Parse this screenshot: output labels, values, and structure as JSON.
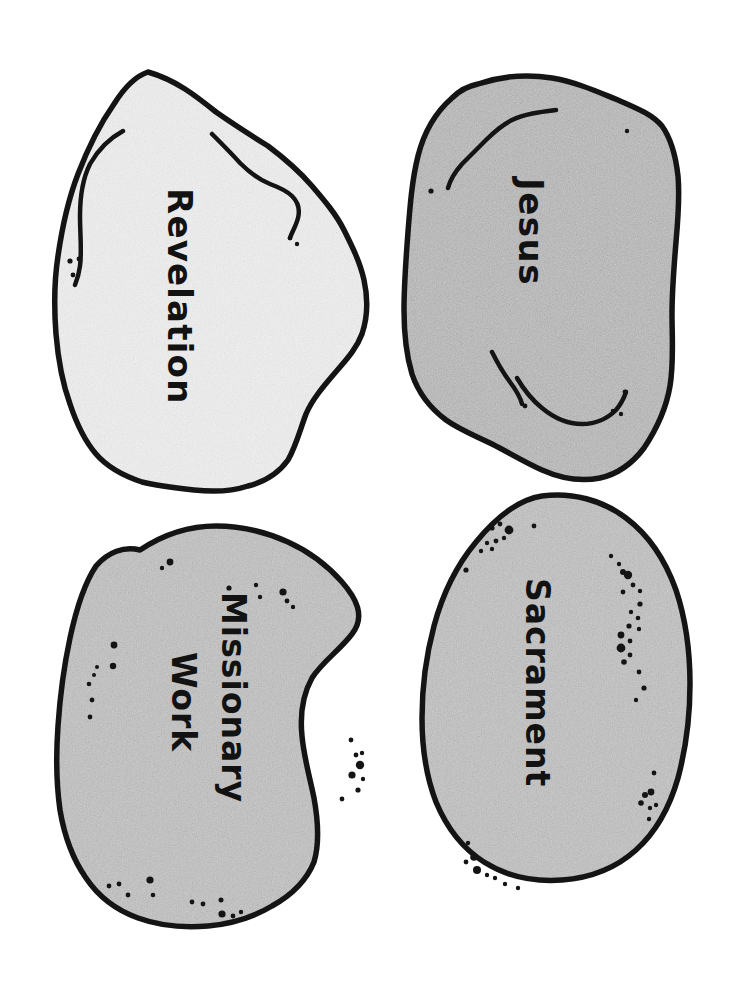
{
  "page": {
    "background_color": "#ffffff",
    "width": 738,
    "height": 1006
  },
  "style": {
    "outline_color": "#141414",
    "crack_color": "#141414",
    "speckle_color": "#141414",
    "fill_light": "#f0f0f0",
    "fill_medium": "#b9b9b9",
    "fill_gray": "#c2c2c2"
  },
  "rocks": [
    {
      "id": "revelation",
      "label": "Revelation",
      "fill": "#f0f0f0",
      "text_rotation_deg": 90,
      "position": "top-left",
      "has_cracks": true,
      "speckle_count": 5
    },
    {
      "id": "jesus",
      "label": "Jesus",
      "fill": "#b9b9b9",
      "text_rotation_deg": 90,
      "position": "top-right",
      "has_cracks": true,
      "speckle_count": 6
    },
    {
      "id": "missionary-work",
      "label": "Missionary Work",
      "label_line_1": "Missionary",
      "label_line_2": "Work",
      "fill": "#c2c2c2",
      "text_rotation_deg": 90,
      "position": "bottom-left",
      "has_cracks": false,
      "speckle_count": 34
    },
    {
      "id": "sacrament",
      "label": "Sacrament",
      "fill": "#c2c2c2",
      "text_rotation_deg": 90,
      "position": "bottom-right",
      "has_cracks": false,
      "speckle_count": 44
    }
  ]
}
